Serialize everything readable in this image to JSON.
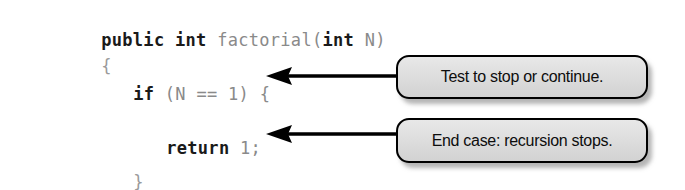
{
  "figure": {
    "type": "annotated-code-figure",
    "background_color": "#ffffff"
  },
  "code": {
    "language": "Java",
    "font": "monospace",
    "keyword_color": "#1a1a1a",
    "plain_color": "#8a8a8a",
    "lines": [
      {
        "id": "signature",
        "tokens": [
          {
            "text": "public",
            "style": "kw"
          },
          {
            "text": " ",
            "style": "plain"
          },
          {
            "text": "int",
            "style": "kw"
          },
          {
            "text": " factorial(",
            "style": "plain"
          },
          {
            "text": "int",
            "style": "kw"
          },
          {
            "text": " N)",
            "style": "plain"
          }
        ],
        "full_text": "public int factorial(int N)"
      },
      {
        "id": "open-brace",
        "tokens": [
          {
            "text": "{",
            "style": "punct"
          }
        ],
        "full_text": "{"
      },
      {
        "id": "if-statement",
        "tokens": [
          {
            "text": "if",
            "style": "kw"
          },
          {
            "text": " (N == 1) {",
            "style": "plain"
          }
        ],
        "full_text": "if (N == 1) {"
      },
      {
        "id": "return-statement",
        "tokens": [
          {
            "text": "return",
            "style": "kw"
          },
          {
            "text": " 1;",
            "style": "plain"
          }
        ],
        "full_text": "return 1;"
      },
      {
        "id": "close-brace",
        "tokens": [
          {
            "text": "}",
            "style": "punct"
          }
        ],
        "full_text": "}"
      }
    ]
  },
  "callouts": [
    {
      "id": "callout-if",
      "text": "Test to stop or continue.",
      "points_to": "if-statement",
      "fill_color": "#dcdcdc",
      "border_color": "#000000",
      "text_color": "#0d0d0d"
    },
    {
      "id": "callout-return",
      "text": "End case: recursion stops.",
      "points_to": "return-statement",
      "fill_color": "#dcdcdc",
      "border_color": "#000000",
      "text_color": "#0d0d0d"
    }
  ],
  "arrows": [
    {
      "id": "arrow-to-if",
      "direction": "left",
      "color": "#000000"
    },
    {
      "id": "arrow-to-return",
      "direction": "left",
      "color": "#000000"
    }
  ]
}
